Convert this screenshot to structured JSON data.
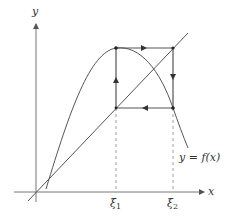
{
  "diagram": {
    "type": "cobweb-diagram",
    "axes": {
      "x_label": "x",
      "y_label": "y"
    },
    "curve_label": "y = f(x)",
    "diagonal": "y = x",
    "ticks": [
      {
        "symbol": "ξ",
        "subscript": "1"
      },
      {
        "symbol": "ξ",
        "subscript": "2"
      }
    ],
    "cycle": {
      "description": "2-cycle between ξ1 and ξ2",
      "path": [
        "(ξ1, ξ1)",
        "(ξ1, ξ2)",
        "(ξ2, ξ2)",
        "(ξ2, ξ1)",
        "(ξ1, ξ1)"
      ]
    },
    "colors": {
      "lines": "#555555",
      "background": "#ffffff"
    }
  }
}
